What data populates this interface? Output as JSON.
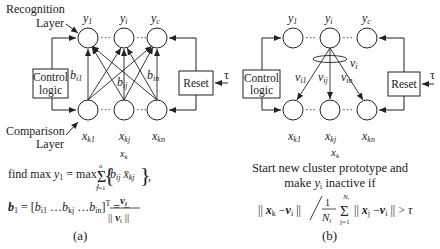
{
  "panel_a": {
    "recognition_label_1": "Recognition",
    "recognition_label_2": "Layer",
    "comparison_label_1": "Comparison",
    "comparison_label_2": "Layer",
    "control_logic_1": "Control",
    "control_logic_2": "logic",
    "reset": "Reset",
    "tau": "τ",
    "top_nodes": [
      "y1",
      "yi",
      "yc"
    ],
    "bottom_nodes": [
      "xk1",
      "xkj",
      "xkn"
    ],
    "weights": [
      "bi1",
      "bij",
      "bin"
    ],
    "input_vector": "xk",
    "formula_1": "find max y1 = max_i { Σ_{j=1}^{a} b_ij x̄_kj },",
    "formula_2": "b_1 = [b_i1 … b_kj … b_in]^T = − v_i / ||v_i||",
    "caption": "(a)"
  },
  "panel_b": {
    "control_logic_1": "Control",
    "control_logic_2": "logic",
    "reset": "Reset",
    "tau": "τ",
    "top_nodes": [
      "y1",
      "yi",
      "yc"
    ],
    "bottom_nodes": [
      "xk1",
      "xkj",
      "xkn"
    ],
    "weights": [
      "vi1",
      "vij",
      "vin"
    ],
    "vector_label": "vi",
    "input_vector": "xk",
    "text_1": "Start new cluster prototype and",
    "text_2": "make yi inactive if",
    "formula": "||x_k − v_i|| / (1/N_i) Σ_{j=1}^{N_i} ||x_j − v_i|| > τ",
    "caption": "(b)"
  }
}
